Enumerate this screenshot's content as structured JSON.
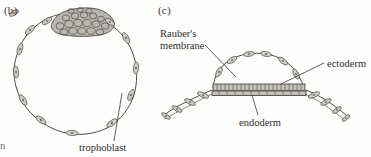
{
  "figure": {
    "kind": "scientific-illustration",
    "background_color": "#fdfdfc",
    "ink_color": "#3b3836"
  },
  "panels": [
    {
      "letter": "(b)",
      "name": "blastocyst-panel",
      "structures": [
        "trophoblast",
        "inner cell mass"
      ]
    },
    {
      "letter": "(c)",
      "name": "embryonic-disc-panel",
      "structures": [
        "Rauber's membrane",
        "ectoderm",
        "endoderm"
      ]
    }
  ],
  "labels": {
    "trophoblast": "trophoblast",
    "raubers_membrane_line1": "Rauber's",
    "raubers_membrane_line2": "membrane",
    "ectoderm": "ectoderm",
    "endoderm": "endoderm"
  },
  "edge_fragment": "n"
}
